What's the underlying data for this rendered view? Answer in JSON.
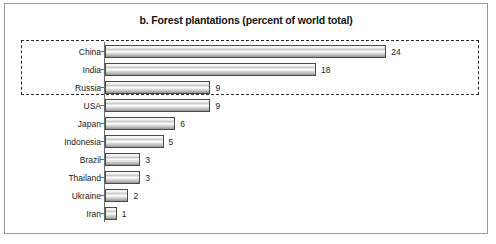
{
  "chart_data": {
    "type": "bar",
    "orientation": "horizontal",
    "title": "b. Forest plantations (percent of world total)",
    "xlabel": "",
    "ylabel": "",
    "xlim": [
      0,
      25
    ],
    "grid": false,
    "legend": null,
    "categories": [
      "China",
      "India",
      "Russia",
      "USA",
      "Japan",
      "Indonesia",
      "Brazil",
      "Thailand",
      "Ukraine",
      "Iran"
    ],
    "values": [
      24,
      18,
      9,
      9,
      6,
      5,
      3,
      3,
      2,
      1
    ],
    "value_labels": [
      "24",
      "18",
      "9",
      "9",
      "6",
      "5",
      "3",
      "3",
      "2",
      "1"
    ],
    "annotations": [
      {
        "name": "highlight-box",
        "kind": "dashed-rectangle",
        "encloses": [
          "China",
          "India",
          "Russia"
        ]
      }
    ]
  },
  "colors": {
    "bar_border": "#4a4a4a",
    "bar_fill_light": "#ffffff",
    "bar_fill_mid": "#c9c9c9",
    "bar_fill_dark": "#8e8e8e",
    "axis": "#6e6e6e",
    "frame": "#9a9a9a",
    "highlight_dash": "#2b2b2b",
    "text": "#1a1a1a"
  }
}
